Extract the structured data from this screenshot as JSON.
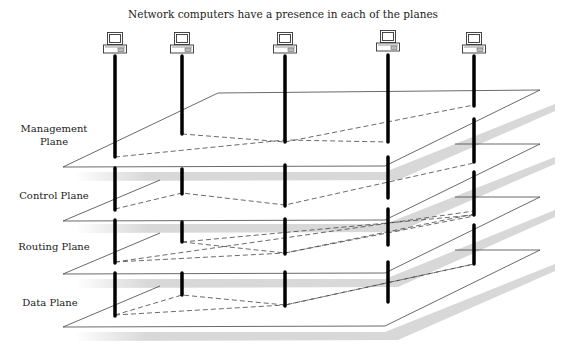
{
  "title": "Network computers have a presence in each of the planes",
  "colors": {
    "line": "#333333",
    "pole": "#000000",
    "shadow": "#d9d9d9",
    "text": "#222222"
  },
  "planes": [
    {
      "id": "management",
      "label_line1": "Management",
      "label_line2": "Plane"
    },
    {
      "id": "control",
      "label_line1": "Control Plane",
      "label_line2": ""
    },
    {
      "id": "routing",
      "label_line1": "Routing Plane",
      "label_line2": ""
    },
    {
      "id": "data",
      "label_line1": "Data Plane",
      "label_line2": ""
    }
  ],
  "computers": [
    {
      "id": "computer-1",
      "icon": "desktop-computer-icon"
    },
    {
      "id": "computer-2",
      "icon": "desktop-computer-icon"
    },
    {
      "id": "computer-3",
      "icon": "desktop-computer-icon"
    },
    {
      "id": "computer-4",
      "icon": "desktop-computer-icon"
    },
    {
      "id": "computer-5",
      "icon": "desktop-computer-icon"
    }
  ]
}
